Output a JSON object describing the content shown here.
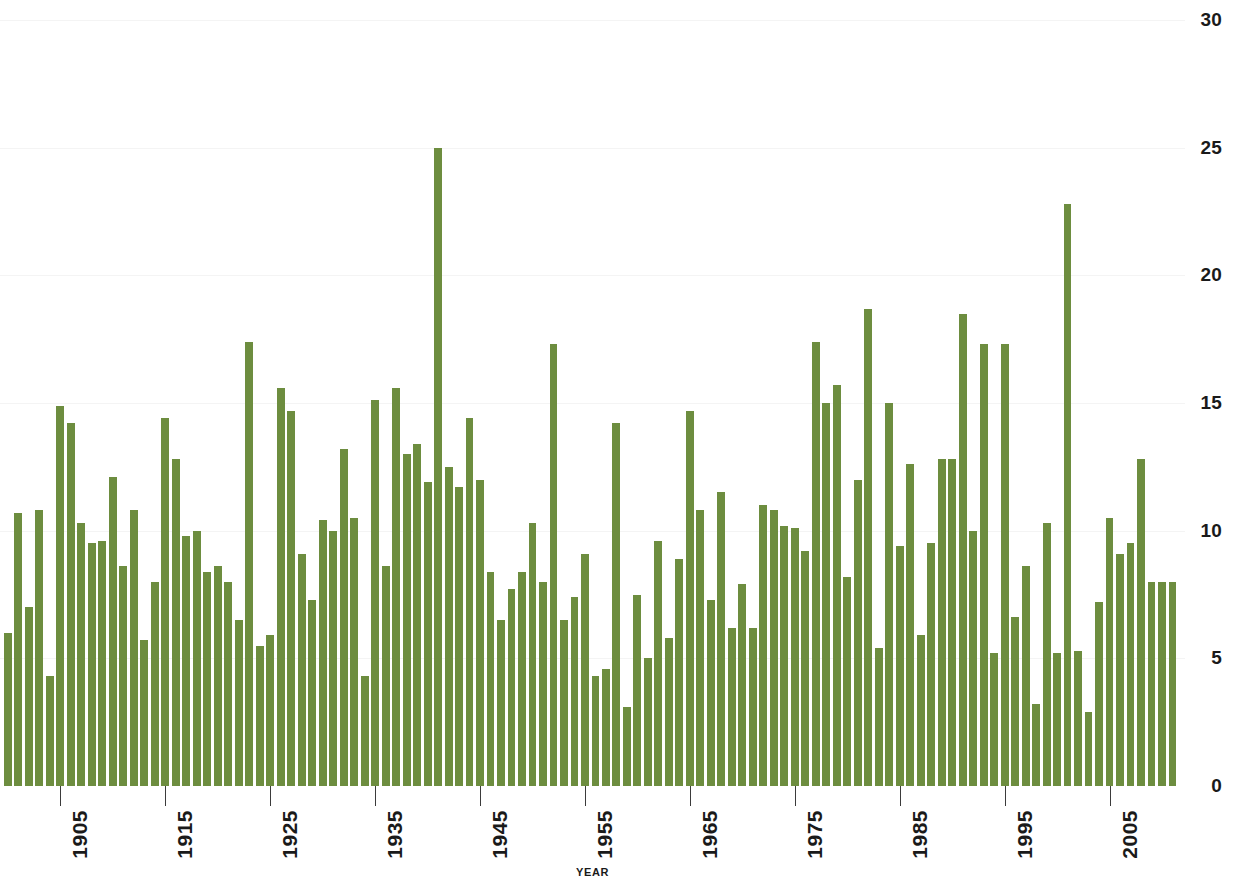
{
  "chart_data": {
    "type": "bar",
    "title": "",
    "subtitle": "",
    "xlabel": "YEAR",
    "ylabel": "",
    "xlim": [
      1899.5,
      2012.5
    ],
    "ylim": [
      0,
      30
    ],
    "grid": true,
    "legend": null,
    "bar_color": "#6d8d3f",
    "grid_color": "#f4f4f4",
    "axis_text_color": "#1a1a1a",
    "y_ticks": [
      0,
      5,
      10,
      15,
      20,
      25,
      30
    ],
    "y_tick_labels": [
      "0",
      "5",
      "10",
      "15",
      "20",
      "25",
      "30"
    ],
    "x_ticks": [
      1905,
      1915,
      1925,
      1935,
      1945,
      1955,
      1965,
      1975,
      1985,
      1995,
      2005
    ],
    "x_tick_labels": [
      "1905",
      "1915",
      "1925",
      "1935",
      "1945",
      "1955",
      "1965",
      "1975",
      "1985",
      "1995",
      "2005"
    ],
    "categories": [
      1900,
      1901,
      1902,
      1903,
      1904,
      1905,
      1906,
      1907,
      1908,
      1909,
      1910,
      1911,
      1912,
      1913,
      1914,
      1915,
      1916,
      1917,
      1918,
      1919,
      1920,
      1921,
      1922,
      1923,
      1924,
      1925,
      1926,
      1927,
      1928,
      1929,
      1930,
      1931,
      1932,
      1933,
      1934,
      1935,
      1936,
      1937,
      1938,
      1939,
      1940,
      1941,
      1942,
      1943,
      1944,
      1945,
      1946,
      1947,
      1948,
      1949,
      1950,
      1951,
      1952,
      1953,
      1954,
      1955,
      1956,
      1957,
      1958,
      1959,
      1960,
      1961,
      1962,
      1963,
      1964,
      1965,
      1966,
      1967,
      1968,
      1969,
      1970,
      1971,
      1972,
      1973,
      1974,
      1975,
      1976,
      1977,
      1978,
      1979,
      1980,
      1981,
      1982,
      1983,
      1984,
      1985,
      1986,
      1987,
      1988,
      1989,
      1990,
      1991,
      1992,
      1993,
      1994,
      1995,
      1996,
      1997,
      1998,
      1999,
      2000,
      2001,
      2002,
      2003,
      2004,
      2005,
      2006,
      2007,
      2008,
      2009,
      2010,
      2011
    ],
    "values": [
      6.0,
      10.7,
      7.0,
      10.8,
      4.3,
      14.9,
      14.2,
      10.3,
      9.5,
      9.6,
      12.1,
      8.6,
      10.8,
      5.7,
      8.0,
      14.4,
      12.8,
      9.8,
      10.0,
      8.4,
      8.6,
      8.0,
      6.5,
      17.4,
      5.5,
      5.9,
      15.6,
      14.7,
      9.1,
      7.3,
      10.4,
      10.0,
      13.2,
      10.5,
      4.3,
      15.1,
      8.6,
      15.6,
      13.0,
      13.4,
      11.9,
      25.0,
      12.5,
      11.7,
      14.4,
      12.0,
      8.4,
      6.5,
      7.7,
      8.4,
      10.3,
      8.0,
      17.3,
      6.5,
      7.4,
      9.1,
      4.3,
      4.6,
      14.2,
      3.1,
      7.5,
      5.0,
      9.6,
      5.8,
      8.9,
      14.7,
      10.8,
      7.3,
      11.5,
      6.2,
      7.9,
      6.2,
      11.0,
      10.8,
      10.2,
      10.1,
      9.2,
      17.4,
      15.0,
      15.7,
      8.2,
      12.0,
      18.7,
      5.4,
      15.0,
      9.4,
      12.6,
      5.9,
      9.5,
      12.8,
      12.8,
      18.5,
      10.0,
      17.3,
      5.2,
      17.3,
      6.6,
      8.6,
      3.2,
      10.3,
      5.2,
      22.8,
      5.3,
      2.9,
      7.2,
      10.5,
      9.1,
      9.5,
      12.8,
      8.0,
      8.0,
      8.0
    ]
  }
}
